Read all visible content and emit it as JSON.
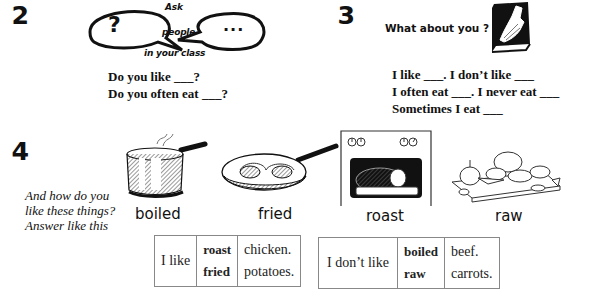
{
  "section2": {
    "number": "2",
    "bubble_left_symbol": "?",
    "bubble_right_symbol": "...",
    "ask_lines": [
      "Ask",
      "people",
      "in your class"
    ],
    "questions": [
      "Do you like ___?",
      "Do you often eat ___?"
    ]
  },
  "section3": {
    "number": "3",
    "prompt": "What about you ?",
    "lines": [
      "I like ___. I don’t like ___",
      "I often eat ___. I never eat ___",
      "Sometimes I eat ___"
    ]
  },
  "section4": {
    "number": "4",
    "instruction_lines": [
      "And how do you",
      "like these things?",
      "Answer like this"
    ],
    "cooking_methods": [
      {
        "label": "boiled",
        "icon": "saucepan-icon"
      },
      {
        "label": "fried",
        "icon": "frying-pan-icon"
      },
      {
        "label": "roast",
        "icon": "oven-icon"
      },
      {
        "label": "raw",
        "icon": "vegetables-icon"
      }
    ],
    "table_like": {
      "subject": "I like",
      "methods": [
        "roast",
        "fried"
      ],
      "foods": [
        "chicken.",
        "potatoes."
      ]
    },
    "table_dislike": {
      "subject": "I don’t like",
      "methods": [
        "boiled",
        "raw"
      ],
      "foods": [
        "beef.",
        "carrots."
      ]
    }
  }
}
